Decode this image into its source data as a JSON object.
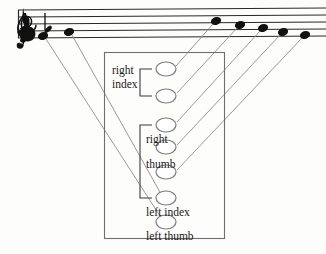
{
  "figure": {
    "kind": "music-fingering-diagram",
    "colors": {
      "background": "#fdfdfc",
      "staff_line": "#2a2a2a",
      "note_head": "#111111",
      "connector_line": "#8e8e8e",
      "circle_outline": "#7d7d7d",
      "box_outline": "#6f6f6f",
      "text": "#1a1a1a"
    }
  },
  "staff": {
    "line_count": 5,
    "clef": "treble-clef",
    "key_signature": "flat-sign",
    "notes": [
      {
        "id": "note-1",
        "cx": 43,
        "cy": 36,
        "label": "left thumb"
      },
      {
        "id": "note-2",
        "cx": 69,
        "cy": 32,
        "label": "left index"
      },
      {
        "id": "note-3",
        "cx": 216,
        "cy": 21,
        "label": "right thumb lower"
      },
      {
        "id": "note-4",
        "cx": 240,
        "cy": 25,
        "label": "right thumb middle"
      },
      {
        "id": "note-5",
        "cx": 263,
        "cy": 28,
        "label": "right thumb upper"
      },
      {
        "id": "note-6",
        "cx": 283,
        "cy": 32,
        "label": "right index lower"
      },
      {
        "id": "note-7",
        "cx": 305,
        "cy": 35,
        "label": "right index upper"
      }
    ]
  },
  "box": {
    "x": 104,
    "y": 52,
    "width": 120,
    "height": 186
  },
  "circles": [
    {
      "id": "circle-1",
      "cx": 166,
      "cy": 69,
      "rx": 10,
      "ry": 7
    },
    {
      "id": "circle-2",
      "cx": 166,
      "cy": 96,
      "rx": 10,
      "ry": 7
    },
    {
      "id": "circle-3",
      "cx": 166,
      "cy": 125,
      "rx": 10,
      "ry": 7
    },
    {
      "id": "circle-4",
      "cx": 166,
      "cy": 147,
      "rx": 10,
      "ry": 7
    },
    {
      "id": "circle-5",
      "cx": 166,
      "cy": 172,
      "rx": 10,
      "ry": 7
    },
    {
      "id": "circle-6",
      "cx": 166,
      "cy": 198,
      "rx": 10,
      "ry": 7
    },
    {
      "id": "circle-7",
      "cx": 166,
      "cy": 222,
      "rx": 10,
      "ry": 7
    }
  ],
  "labels": {
    "right_index_line1": "right",
    "right_index_line2": "index",
    "right_thumb_line1": "right",
    "right_thumb_line2": "thumb",
    "left_index": "left index",
    "left_thumb": "left thumb"
  },
  "brackets": [
    {
      "id": "bracket-right-index",
      "x": 140,
      "y_top": 69,
      "y_bottom": 96,
      "arm": 12
    },
    {
      "id": "bracket-right-thumb",
      "x": 140,
      "y_top": 125,
      "y_bottom": 198,
      "arm": 12
    }
  ],
  "connectors": [
    {
      "id": "connector-1",
      "from": "note-1",
      "x1": 46,
      "y1": 39,
      "x2": 160,
      "y2": 216
    },
    {
      "id": "connector-2",
      "from": "note-2",
      "x1": 72,
      "y1": 35,
      "x2": 161,
      "y2": 194
    },
    {
      "id": "connector-3",
      "from": "note-3",
      "x1": 213,
      "y1": 24,
      "x2": 176,
      "y2": 66
    },
    {
      "id": "connector-4",
      "from": "note-4",
      "x1": 237,
      "y1": 28,
      "x2": 177,
      "y2": 93
    },
    {
      "id": "connector-5",
      "from": "note-5",
      "x1": 260,
      "y1": 31,
      "x2": 177,
      "y2": 122
    },
    {
      "id": "connector-6",
      "from": "note-6",
      "x1": 280,
      "y1": 35,
      "x2": 177,
      "y2": 145
    },
    {
      "id": "connector-7",
      "from": "note-7",
      "x1": 302,
      "y1": 38,
      "x2": 177,
      "y2": 170
    }
  ]
}
